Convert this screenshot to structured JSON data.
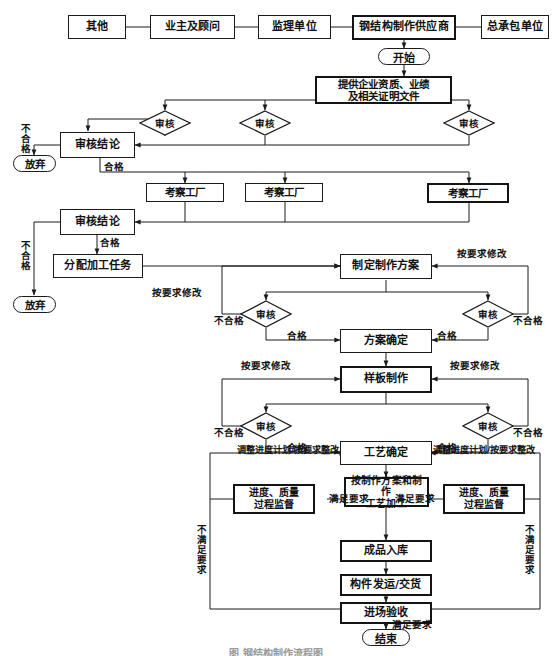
{
  "figure": {
    "caption": "图  钢结构制作流程图",
    "language": "zh-CN",
    "colors": {
      "line": "#1b1b1b",
      "text": "#111111",
      "background": "#ffffff",
      "caption": "#9a9a9a"
    }
  },
  "nodes": {
    "party_other": "其他",
    "party_owner": "业主及顾问",
    "party_supervisor": "监理单位",
    "party_steel_supplier": "钢结构制作供应商",
    "party_general_contractor": "总承包单位",
    "start": "开始",
    "submit_docs": "提供企业资质、业绩\n及相关证明文件",
    "review_1": "审核",
    "review_2": "审核",
    "review_3": "审核",
    "review_conclusion_1": "审核结论",
    "abandon_1": "放弃",
    "factory_visit_1": "考察工厂",
    "factory_visit_2": "考察工厂",
    "factory_visit_3": "考察工厂",
    "review_conclusion_2": "审核结论",
    "abandon_2": "放弃",
    "assign_task": "分配加工任务",
    "make_plan": "制定制作方案",
    "review_plan_left": "审核",
    "review_plan_right": "审核",
    "plan_confirmed": "方案确定",
    "sample_making": "样板制作",
    "review_sample_left": "审核",
    "review_sample_right": "审核",
    "process_confirmed": "工艺确定",
    "fabrication": "按制作方案和制作\n工艺加工",
    "monitor_left": "进度、质量\n过程监督",
    "monitor_right": "进度、质量\n过程监督",
    "finished_storage": "成品入库",
    "delivery": "构件发运/交货",
    "site_acceptance": "进场验收",
    "end": "结束"
  },
  "edge_labels": {
    "unqualified_v1": "不合格",
    "qualified_1": "合格",
    "unqualified_v2": "不合格",
    "qualified_2": "合格",
    "modify_left_plan": "按要求修改",
    "modify_right_plan": "按要求修改",
    "unqualified_plan_left": "不合格",
    "qualified_plan_left": "合格",
    "qualified_plan_right": "合格",
    "unqualified_plan_right": "不合格",
    "modify_left_sample": "按要求修改",
    "modify_right_sample": "按要求修改",
    "unqualified_sample_left": "不合格",
    "qualified_sample_left": "合格",
    "qualified_sample_right": "合格",
    "unqualified_sample_right": "不合格",
    "adjust_left": "调整进度计划/按要求整改",
    "adjust_right": "调整进度计划/按要求整改",
    "meets_left": "满足要求",
    "meets_right": "满足要求",
    "not_meets_left": "不满足要求",
    "not_meets_right": "不满足要求",
    "meets_end": "满足要求"
  }
}
